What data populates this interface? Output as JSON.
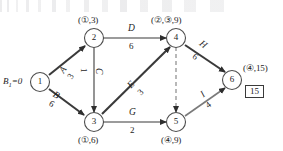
{
  "diagram": {
    "kind": "activity-on-arrow network diagram (CPM/AOA)",
    "start_label": "B₁=0",
    "total_box": "15",
    "nodes": [
      {
        "id": "1",
        "number": "1",
        "tag": "",
        "x": 40,
        "y": 82
      },
      {
        "id": "2",
        "number": "2",
        "tag": "(①,3)",
        "x": 94,
        "y": 38
      },
      {
        "id": "3",
        "number": "3",
        "tag": "(①,6)",
        "x": 94,
        "y": 122
      },
      {
        "id": "4",
        "number": "4",
        "tag": "(②,③,9)",
        "x": 176,
        "y": 38
      },
      {
        "id": "5",
        "number": "5",
        "tag": "(④,9)",
        "x": 176,
        "y": 122
      },
      {
        "id": "6",
        "number": "6",
        "tag": "(④,15)",
        "x": 232,
        "y": 80
      }
    ],
    "edges": [
      {
        "name": "A",
        "weight": "3",
        "from": "1",
        "to": "2"
      },
      {
        "name": "B",
        "weight": "6",
        "from": "1",
        "to": "3"
      },
      {
        "name": "C",
        "weight": "1",
        "from": "2",
        "to": "3"
      },
      {
        "name": "D",
        "weight": "6",
        "from": "2",
        "to": "4"
      },
      {
        "name": "E",
        "weight": "3",
        "from": "3",
        "to": "4"
      },
      {
        "name": "G",
        "weight": "2",
        "from": "3",
        "to": "5"
      },
      {
        "name": "H",
        "weight": "6",
        "from": "4",
        "to": "6"
      },
      {
        "name": "I",
        "weight": "4",
        "from": "5",
        "to": "6"
      },
      {
        "name": "",
        "weight": "",
        "from": "4",
        "to": "5",
        "style": "dashed-dummy"
      }
    ],
    "colors": {
      "node_stroke": "#4d4d4d",
      "edge_light": "#7a7a7a",
      "edge_dark": "#3a3a3a",
      "text": "#1d1d1d",
      "background": "#ffffff"
    }
  }
}
